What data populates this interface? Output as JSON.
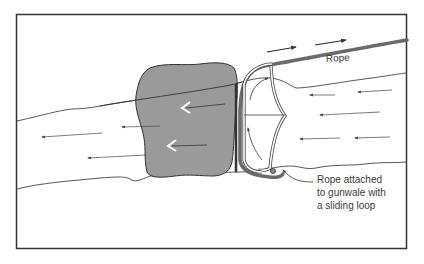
{
  "diagram": {
    "type": "illustration",
    "labels": {
      "rope": "Rope",
      "attachment_line1": "Rope attached",
      "attachment_line2": "to gunwale with",
      "attachment_line3": "a sliding loop"
    },
    "colors": {
      "frame": "#333333",
      "rock_fill": "#9a9a9a",
      "rope": "#666666",
      "line": "#444444",
      "background": "#ffffff"
    },
    "elements": [
      "frame",
      "river-banks",
      "rock",
      "canoe",
      "rope",
      "current-arrows",
      "rope-pull-arrows",
      "rotation-arrows",
      "leader-line"
    ]
  }
}
